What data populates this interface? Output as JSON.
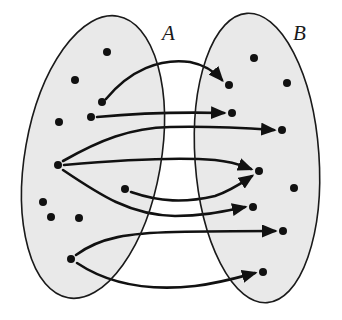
{
  "diagram": {
    "colors": {
      "ellipse_fill": "#e9e9e9",
      "stroke": "#1a1a1a",
      "dot": "#111111"
    },
    "sets": [
      {
        "id": "A",
        "label": "A",
        "label_pos": [
          162,
          40
        ],
        "ellipse": {
          "cx": 93,
          "cy": 157,
          "rx": 68,
          "ry": 143,
          "rotate": 10
        },
        "elements": [
          {
            "id": "a1",
            "x": 107,
            "y": 52
          },
          {
            "id": "a2",
            "x": 75,
            "y": 80
          },
          {
            "id": "a3",
            "x": 102,
            "y": 102
          },
          {
            "id": "a4",
            "x": 91,
            "y": 117
          },
          {
            "id": "a5",
            "x": 59,
            "y": 122
          },
          {
            "id": "a6",
            "x": 58,
            "y": 165
          },
          {
            "id": "a7",
            "x": 125,
            "y": 189
          },
          {
            "id": "a8",
            "x": 43,
            "y": 202
          },
          {
            "id": "a9",
            "x": 51,
            "y": 217
          },
          {
            "id": "a10",
            "x": 79,
            "y": 218
          },
          {
            "id": "a11",
            "x": 71,
            "y": 259
          }
        ]
      },
      {
        "id": "B",
        "label": "B",
        "label_pos": [
          293,
          40
        ],
        "ellipse": {
          "cx": 257,
          "cy": 158,
          "rx": 62,
          "ry": 145,
          "rotate": -4
        },
        "elements": [
          {
            "id": "b1",
            "x": 254,
            "y": 58
          },
          {
            "id": "b2",
            "x": 229,
            "y": 85
          },
          {
            "id": "b3",
            "x": 287,
            "y": 83
          },
          {
            "id": "b4",
            "x": 232,
            "y": 113
          },
          {
            "id": "b5",
            "x": 282,
            "y": 130
          },
          {
            "id": "b6",
            "x": 259,
            "y": 171
          },
          {
            "id": "b7",
            "x": 294,
            "y": 188
          },
          {
            "id": "b8",
            "x": 253,
            "y": 207
          },
          {
            "id": "b9",
            "x": 283,
            "y": 231
          },
          {
            "id": "b10",
            "x": 263,
            "y": 272
          }
        ]
      }
    ],
    "mappings": [
      {
        "from": "a3",
        "to": "b2",
        "path": "M106,99 C130,70 160,58 190,62 C205,65 215,72 222,80"
      },
      {
        "from": "a4",
        "to": "b4",
        "path": "M97,117 C140,113 185,112 224,113"
      },
      {
        "from": "a6",
        "to": "b5",
        "path": "M63,161 C100,140 130,128 170,127 C210,126 245,128 274,130"
      },
      {
        "from": "a6",
        "to": "b6",
        "path": "M64,165 C120,160 180,157 215,160 C235,162 243,166 251,169"
      },
      {
        "from": "a6",
        "to": "b8",
        "path": "M63,170 C100,195 130,215 175,216 C205,216 225,211 245,207"
      },
      {
        "from": "a7",
        "to": "b6",
        "path": "M131,192 C160,202 185,203 215,196 C232,190 243,182 252,176"
      },
      {
        "from": "a11",
        "to": "b9",
        "path": "M76,255 C100,237 130,233 175,232 C215,231 250,231 275,231"
      },
      {
        "from": "a11",
        "to": "b10",
        "path": "M77,263 C110,285 150,291 195,286 C220,283 240,277 255,273"
      }
    ]
  }
}
